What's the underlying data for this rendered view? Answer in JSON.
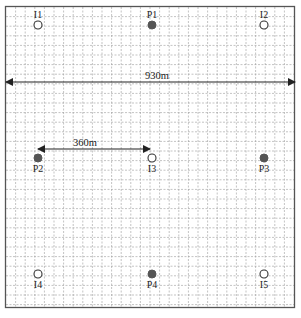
{
  "diagram": {
    "type": "well-pattern layout",
    "colors": {
      "frame": "#555555",
      "grid": "#9a9a9a",
      "production_well": "#555555",
      "injection_well_stroke": "#333333",
      "arrow": "#222222"
    },
    "wells": [
      {
        "id": "I1",
        "kind": "injector",
        "label": "I1",
        "x": 38,
        "y": 25,
        "label_pos": "above"
      },
      {
        "id": "P1",
        "kind": "producer",
        "label": "P1",
        "x": 152,
        "y": 25,
        "label_pos": "above"
      },
      {
        "id": "I2",
        "kind": "injector",
        "label": "I2",
        "x": 264,
        "y": 25,
        "label_pos": "above"
      },
      {
        "id": "P2",
        "kind": "producer",
        "label": "P2",
        "x": 38,
        "y": 158,
        "label_pos": "below"
      },
      {
        "id": "I3",
        "kind": "injector",
        "label": "I3",
        "x": 152,
        "y": 158,
        "label_pos": "below"
      },
      {
        "id": "P3",
        "kind": "producer",
        "label": "P3",
        "x": 264,
        "y": 158,
        "label_pos": "below"
      },
      {
        "id": "I4",
        "kind": "injector",
        "label": "I4",
        "x": 38,
        "y": 274,
        "label_pos": "below"
      },
      {
        "id": "P4",
        "kind": "producer",
        "label": "P4",
        "x": 152,
        "y": 274,
        "label_pos": "below"
      },
      {
        "id": "I5",
        "kind": "injector",
        "label": "I5",
        "x": 264,
        "y": 274,
        "label_pos": "below"
      }
    ],
    "dimensions": [
      {
        "id": "width",
        "label": "930m",
        "x1": 6,
        "x2": 295,
        "y": 82,
        "label_x": 145,
        "label_y": 70
      },
      {
        "id": "spacing",
        "label": "360m",
        "x1": 38,
        "x2": 150,
        "y": 149,
        "label_x": 73,
        "label_y": 137
      }
    ]
  }
}
